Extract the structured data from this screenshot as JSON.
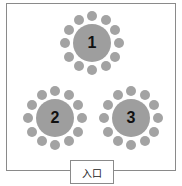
{
  "diagram": {
    "type": "floor-plan",
    "tables": [
      {
        "label": "1",
        "cx": 92,
        "cy": 43,
        "seats": 12
      },
      {
        "label": "2",
        "cx": 55,
        "cy": 118,
        "seats": 12
      },
      {
        "label": "3",
        "cx": 131,
        "cy": 118,
        "seats": 12
      }
    ],
    "entrance": {
      "label": "入口"
    },
    "colors": {
      "table": "#9e9e9e",
      "seat": "#a3a3a3",
      "border": "#8a8a8a"
    }
  }
}
